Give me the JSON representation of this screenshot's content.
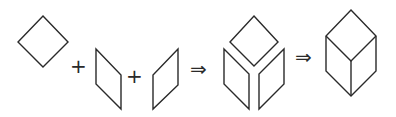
{
  "diagram": {
    "stroke_color": "#2a2a2a",
    "background": "#ffffff",
    "operators": {
      "plus_1": "+",
      "plus_2": "+",
      "implies_1": "⇒",
      "implies_2": "⇒"
    },
    "steps": [
      {
        "label": "top-face-rhombus",
        "points": "43,16 68,42 43,67 18,42"
      },
      {
        "label": "left-face-parallelogram",
        "points": "96,49 121,75 121,109 96,84"
      },
      {
        "label": "right-face-parallelogram",
        "points": "178,49 178,85 153,109 153,75"
      },
      {
        "label": "exploded-top",
        "points": "254,16 278,42 254,66 230,42"
      },
      {
        "label": "exploded-left",
        "points": "224,49 249,74 249,109 224,84"
      },
      {
        "label": "exploded-right",
        "points": "284,49 284,84 259,109 259,74"
      },
      {
        "label": "cube-outline",
        "points": "351,10 376,36 376,71 351,96 326,71 326,36"
      },
      {
        "label": "cube-inner-edges",
        "points": "326,36 351,61 376,36 M351,61 351,96"
      }
    ]
  }
}
